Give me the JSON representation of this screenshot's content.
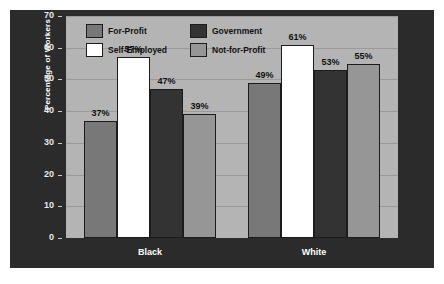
{
  "chart_data": {
    "type": "bar",
    "title": "",
    "subtitle": "",
    "xlabel": "",
    "ylabel": "Percentage of Workers",
    "ylim": [
      0,
      70
    ],
    "yticks": [
      0,
      10,
      20,
      30,
      40,
      50,
      60,
      70
    ],
    "ytick_labels": [
      "0",
      "10",
      "20",
      "30",
      "40",
      "50",
      "60",
      "70"
    ],
    "grid": true,
    "legend_position": "top-left-inside",
    "categories": [
      "Black",
      "White"
    ],
    "series": [
      {
        "name": "For-Profit",
        "color": "#787878",
        "values": [
          37,
          49
        ],
        "labels": [
          "37%",
          "49%"
        ]
      },
      {
        "name": "Self-Employed",
        "color": "#ffffff",
        "values": [
          57,
          61
        ],
        "labels": [
          "57%",
          "61%"
        ]
      },
      {
        "name": "Government",
        "color": "#333333",
        "values": [
          47,
          53
        ],
        "labels": [
          "47%",
          "53%"
        ]
      },
      {
        "name": "Not-for-Profit",
        "color": "#969696",
        "values": [
          39,
          55
        ],
        "labels": [
          "39%",
          "55%"
        ]
      }
    ],
    "value_label_suffix": "%"
  },
  "legend": {
    "items": [
      {
        "label": "For-Profit",
        "color": "#787878"
      },
      {
        "label": "Government",
        "color": "#333333"
      },
      {
        "label": "Self-Employed",
        "color": "#ffffff"
      },
      {
        "label": "Not-for-Profit",
        "color": "#969696"
      }
    ]
  },
  "colors": {
    "page_background": "#ffffff",
    "panel_background": "#2b2b2b",
    "plot_background": "#b4b4b4",
    "gridline": "#9a9a9a",
    "axis_text": "#e8e8e8",
    "value_text": "#111111",
    "bar_outline": "#1c1c1c"
  }
}
